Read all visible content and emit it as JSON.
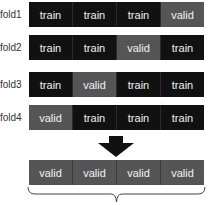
{
  "folds": [
    {
      "label": "fold1",
      "cells": [
        "train",
        "train",
        "train",
        "valid"
      ]
    },
    {
      "label": "fold2",
      "cells": [
        "train",
        "train",
        "valid",
        "train"
      ]
    },
    {
      "label": "fold3",
      "cells": [
        "train",
        "valid",
        "train",
        "train"
      ]
    },
    {
      "label": "fold4",
      "cells": [
        "valid",
        "train",
        "train",
        "train"
      ]
    }
  ],
  "result": {
    "cells": [
      "valid",
      "valid",
      "valid",
      "valid"
    ]
  },
  "colors": {
    "train": "#111111",
    "valid": "#555555"
  },
  "icons": {
    "arrow": "down-arrow-icon",
    "brace": "curly-brace-icon"
  }
}
